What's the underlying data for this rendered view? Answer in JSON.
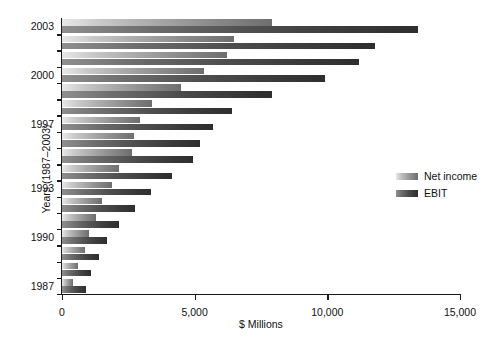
{
  "chart_data": {
    "type": "bar",
    "orientation": "horizontal",
    "title": "",
    "xlabel": "$ Millions",
    "ylabel": "Years (1987–2003)",
    "xlim": [
      0,
      15000
    ],
    "xticks": [
      0,
      5000,
      10000,
      15000
    ],
    "xtick_labels": [
      "0",
      "5,000",
      "10,000",
      "15,000"
    ],
    "grid": false,
    "legend_position": "right",
    "categories": [
      "2003",
      "2002",
      "2001",
      "2000",
      "1999",
      "1998",
      "1997",
      "1996",
      "1995",
      "1994",
      "1993",
      "1992",
      "1991",
      "1990",
      "1989",
      "1988",
      "1987"
    ],
    "ytick_labels": [
      "2003",
      "2000",
      "1997",
      "1993",
      "1990",
      "1987"
    ],
    "series": [
      {
        "name": "Net income",
        "color": "#a8a8a8",
        "values": [
          7900,
          6500,
          6200,
          5350,
          4500,
          3400,
          2950,
          2700,
          2650,
          2150,
          1900,
          1500,
          1300,
          1000,
          850,
          600,
          400
        ]
      },
      {
        "name": "EBIT",
        "color": "#4d4d4d",
        "values": [
          13400,
          11800,
          11200,
          9900,
          7900,
          6400,
          5700,
          5200,
          4950,
          4150,
          3350,
          2750,
          2150,
          1700,
          1400,
          1100,
          900
        ]
      }
    ]
  },
  "legend": {
    "items": [
      {
        "label": "Net income",
        "swatch": "net-income-swatch"
      },
      {
        "label": "EBIT",
        "swatch": "ebit-swatch"
      }
    ]
  }
}
